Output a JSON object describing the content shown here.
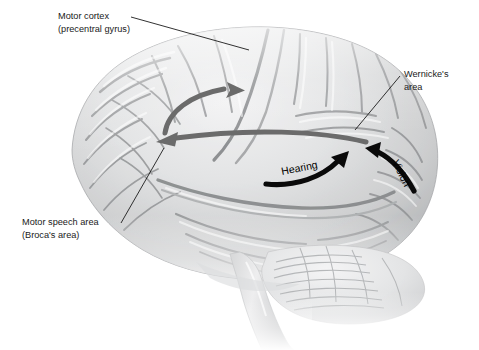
{
  "figure": {
    "background_color": "#ffffff",
    "width": 479,
    "height": 350
  },
  "labels": {
    "motor_cortex": {
      "line1": "Motor cortex",
      "line2": "(precentral gyrus)",
      "x": 58,
      "y": 14
    },
    "wernicke": {
      "line1": "Wernicke's",
      "line2": "area",
      "x": 404,
      "y": 72
    },
    "broca": {
      "line1": "Motor speech area",
      "line2": "(Broca's area)",
      "x": 22,
      "y": 220
    }
  },
  "pathway_labels": {
    "hearing": "Hearing",
    "vision": "Vision"
  },
  "colors": {
    "gray_arrow": "#6b6b6b",
    "black_arrow": "#0a0a0a",
    "leader_line": "#1b1b1b",
    "text": "#1a1a1a",
    "brain_light": "#ececed",
    "brain_mid": "#c9cacb",
    "brain_shadow": "#9a9b9d",
    "brain_dark": "#77797b"
  },
  "arrows": {
    "gray_up": {
      "name": "wernicke-to-motor-cortex-arc",
      "direction": "up-right"
    },
    "gray_long": {
      "name": "wernicke-to-broca-arcuate-fasciculus",
      "direction": "left"
    },
    "hearing": {
      "name": "auditory-input-to-wernicke",
      "direction": "up-right"
    },
    "vision": {
      "name": "visual-input-to-wernicke",
      "direction": "up-left"
    }
  }
}
